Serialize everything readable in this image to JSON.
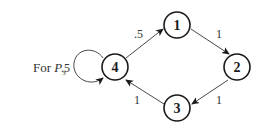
{
  "caption": {
    "prefix": "For ",
    "symbol": "P",
    "subscript": "3"
  },
  "nodes": [
    {
      "id": "1",
      "label": "1",
      "x": 177,
      "y": 25
    },
    {
      "id": "2",
      "label": "2",
      "x": 237,
      "y": 67
    },
    {
      "id": "3",
      "label": "3",
      "x": 177,
      "y": 108
    },
    {
      "id": "4",
      "label": "4",
      "x": 115,
      "y": 67
    }
  ],
  "edges": [
    {
      "from": "4",
      "to": "1",
      "label": ".5"
    },
    {
      "from": "1",
      "to": "2",
      "label": "1"
    },
    {
      "from": "2",
      "to": "3",
      "label": "1"
    },
    {
      "from": "3",
      "to": "4",
      "label": "1"
    },
    {
      "from": "4",
      "to": "4",
      "label": ".5"
    }
  ],
  "colors": {
    "stroke": "#1a1a1a",
    "edge": "#333333",
    "background": "#ffffff"
  }
}
